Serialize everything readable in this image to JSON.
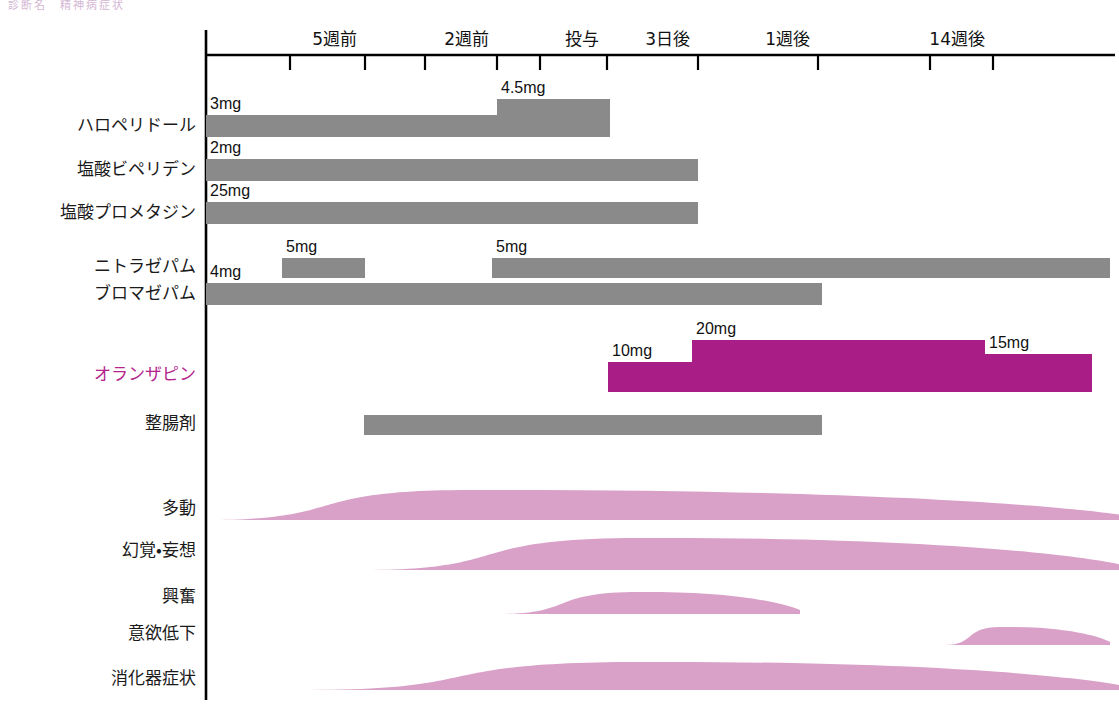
{
  "figure": {
    "caption": "診断名　精神病症状",
    "colors": {
      "drug_bar": "#8a8a8a",
      "accent_bar": "#a81e86",
      "accent_text": "#b3258d",
      "symptom_curve": "#d9a0c8",
      "axis": "#000000"
    }
  },
  "axis": {
    "orientation": "horizontal",
    "ticks": [
      {
        "label": "5週前",
        "x": 365
      },
      {
        "label": "2週前",
        "x": 497
      },
      {
        "label": "投与",
        "x": 607
      },
      {
        "label": "3日後",
        "x": 698
      },
      {
        "label": "1週後",
        "x": 818
      },
      {
        "label": "14週後",
        "x": 993
      }
    ]
  },
  "chart_data": {
    "type": "bar",
    "title": "診断名　精神病症状",
    "xlabel": "",
    "ylabel": "",
    "categories": [
      "ハロペリドール",
      "塩酸ビペリデン",
      "塩酸プロメタジン",
      "ニトラゼパム",
      "ブロマゼパム",
      "オランザピン",
      "整腸剤",
      "多動",
      "幻覚・妄想",
      "興奮",
      "意欲低下",
      "消化器症状"
    ],
    "medications": [
      {
        "name": "ハロペリドール",
        "accent": false,
        "segments": [
          {
            "dose": "3mg",
            "start": 206,
            "end": 497,
            "thickness": 22
          },
          {
            "dose": "4.5mg",
            "start": 497,
            "end": 610,
            "thickness": 38
          }
        ]
      },
      {
        "name": "塩酸ビペリデン",
        "accent": false,
        "segments": [
          {
            "dose": "2mg",
            "start": 206,
            "end": 698,
            "thickness": 22
          }
        ]
      },
      {
        "name": "塩酸プロメタジン",
        "accent": false,
        "segments": [
          {
            "dose": "25mg",
            "start": 206,
            "end": 698,
            "thickness": 22
          }
        ]
      },
      {
        "name": "ニトラゼパム",
        "accent": false,
        "segments": [
          {
            "dose": "5mg",
            "start": 282,
            "end": 365,
            "thickness": 20
          },
          {
            "dose": "5mg",
            "start": 492,
            "end": 1110,
            "thickness": 20
          }
        ]
      },
      {
        "name": "ブロマゼパム",
        "accent": false,
        "segments": [
          {
            "dose": "4mg",
            "start": 206,
            "end": 822,
            "thickness": 22
          }
        ]
      },
      {
        "name": "オランザピン",
        "accent": true,
        "segments": [
          {
            "dose": "10mg",
            "start": 608,
            "end": 692,
            "thickness": 30
          },
          {
            "dose": "20mg",
            "start": 692,
            "end": 985,
            "thickness": 52
          },
          {
            "dose": "15mg",
            "start": 985,
            "end": 1092,
            "thickness": 38
          }
        ]
      },
      {
        "name": "整腸剤",
        "accent": false,
        "segments": [
          {
            "dose": "",
            "start": 364,
            "end": 822,
            "thickness": 20
          }
        ]
      }
    ],
    "symptoms": [
      {
        "name": "多動",
        "start": 206,
        "peak": 470,
        "end": 1119,
        "height": 30
      },
      {
        "name": "幻覚・妄想",
        "start": 364,
        "peak": 640,
        "end": 1119,
        "height": 32
      },
      {
        "name": "興奮",
        "start": 498,
        "peak": 640,
        "end": 800,
        "height": 22
      },
      {
        "name": "意欲低下",
        "start": 945,
        "peak": 1000,
        "end": 1110,
        "height": 18
      },
      {
        "name": "消化器症状",
        "start": 310,
        "peak": 640,
        "end": 1119,
        "height": 28
      }
    ]
  }
}
